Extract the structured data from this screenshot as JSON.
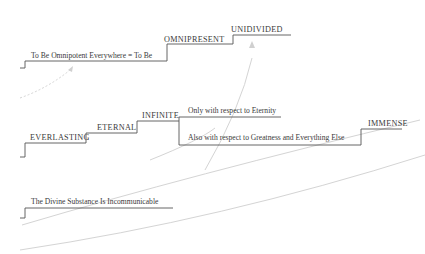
{
  "diagram": {
    "type": "step-ladder concept diagram",
    "colors": {
      "line": "#555555",
      "text": "#3a3a3a",
      "faint_connector": "#d4d4d4",
      "background": "#ffffff"
    },
    "rows": [
      {
        "id": "row-omnipresence",
        "steps": [
          {
            "label": "To Be Omnipotent Everywhere = To Be"
          },
          {
            "label": "OMNIPRESENT"
          },
          {
            "label": "UNIDIVIDED"
          }
        ]
      },
      {
        "id": "row-eternity",
        "steps": [
          {
            "label": "EVERLASTING"
          },
          {
            "label": "ETERNAL"
          },
          {
            "label": "INFINITE"
          }
        ],
        "branch": {
          "upper": "Only with respect to Eternity",
          "lower": "Also with respect to Greatness and Everything Else"
        },
        "final_step": {
          "label": "IMMENSE"
        }
      },
      {
        "id": "row-incommunicable",
        "steps": [
          {
            "label": "The Divine Substance Is Incommunicable"
          }
        ]
      }
    ],
    "connectors": [
      {
        "from": "left margin below row 1",
        "to": "To Be Omnipotent Everywhere = To Be",
        "style": "faint dashed arrow"
      },
      {
        "from": "Also with respect to Greatness and Everything Else",
        "to": "UNIDIVIDED",
        "style": "faint arrow"
      }
    ]
  }
}
